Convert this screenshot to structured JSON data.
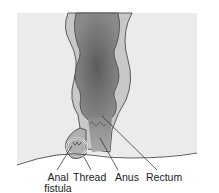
{
  "diagram": {
    "labels": [
      {
        "id": "anal-fistula",
        "line1": "Anal",
        "line2": "fistula"
      },
      {
        "id": "thread",
        "line1": "Thread"
      },
      {
        "id": "anus",
        "line1": "Anus"
      },
      {
        "id": "rectum",
        "line1": "Rectum"
      }
    ],
    "colors": {
      "background_panel": "#ebebeb",
      "tissue": "#c8c8c8",
      "lumen_dark": "#6e6e6e",
      "lumen_light": "#9a9a9a",
      "outline": "#3a3a3a",
      "thread": "#ffffff"
    }
  }
}
